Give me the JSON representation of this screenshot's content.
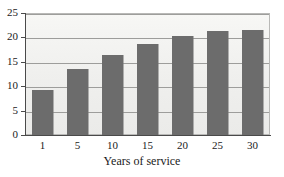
{
  "chart_data": {
    "type": "bar",
    "title": "",
    "xlabel": "Years of service",
    "ylabel": "",
    "categories": [
      "1",
      "5",
      "10",
      "15",
      "20",
      "25",
      "30"
    ],
    "values": [
      9.3,
      13.5,
      16.4,
      18.7,
      20.2,
      21.4,
      21.6
    ],
    "ylim": [
      0,
      25
    ],
    "yticks": [
      0,
      5,
      10,
      15,
      20,
      25
    ],
    "ytick_labels": [
      "0",
      "5",
      "10",
      "15",
      "20",
      "25"
    ],
    "grid": true,
    "grid_axis": "y",
    "legend": false,
    "legend_position": "none",
    "colors": {
      "bar_fill": "#6c6c6c",
      "plot_background": "#f2f2f0",
      "gridline": "#9d9d9b",
      "axis": "#4a4a4a",
      "text": "#1a1a1a",
      "figure_background": "#ffffff"
    }
  }
}
